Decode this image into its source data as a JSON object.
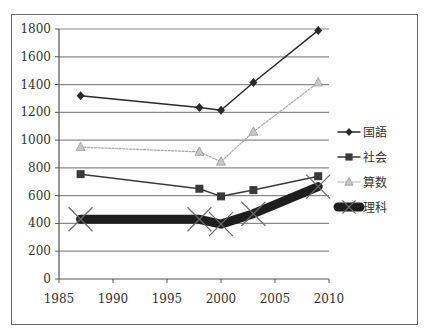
{
  "chart_data": {
    "type": "line",
    "title": "",
    "xlabel": "",
    "ylabel": "",
    "xlim": [
      1985,
      2010
    ],
    "ylim": [
      0,
      1800
    ],
    "x_ticks": [
      1985,
      1990,
      1995,
      2000,
      2005,
      2010
    ],
    "y_ticks": [
      0,
      200,
      400,
      600,
      800,
      1000,
      1200,
      1400,
      1600,
      1800
    ],
    "grid": {
      "horizontal": true,
      "vertical": false
    },
    "legend_position": "right",
    "series": [
      {
        "name": "国語",
        "marker": "diamond",
        "color": "#2a2a2a",
        "line_width": 1.5,
        "dash": "",
        "x": [
          1987,
          1998,
          2000,
          2003,
          2009
        ],
        "values": [
          1320,
          1235,
          1215,
          1415,
          1790
        ]
      },
      {
        "name": "社会",
        "marker": "square",
        "color": "#3a3a3a",
        "line_width": 1.5,
        "dash": "",
        "x": [
          1987,
          1998,
          2000,
          2003,
          2009
        ],
        "values": [
          755,
          650,
          595,
          640,
          740
        ]
      },
      {
        "name": "算数",
        "marker": "triangle",
        "color": "#a8a8a8",
        "line_width": 1.2,
        "dash": "2,1.5",
        "x": [
          1987,
          1998,
          2000,
          2003,
          2009
        ],
        "values": [
          950,
          915,
          845,
          1060,
          1415
        ]
      },
      {
        "name": "理科",
        "marker": "x",
        "color": "#1e1e1e",
        "line_width": 9,
        "dash": "",
        "x": [
          1987,
          1998,
          2000,
          2003,
          2009
        ],
        "values": [
          430,
          430,
          395,
          470,
          665
        ]
      }
    ]
  }
}
